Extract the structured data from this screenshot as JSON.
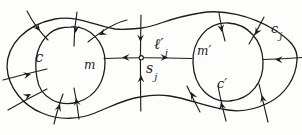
{
  "figure": {
    "description_labels": {
      "inner_cycle_left": {
        "base": "c"
      },
      "point_m": {
        "base": "m"
      },
      "separatrix_l": {
        "base": "ℓ′",
        "sub": "j"
      },
      "saddle_s": {
        "base": "s",
        "sub": "j"
      },
      "point_m_prime": {
        "base": "m′"
      },
      "inner_cycle_right": {
        "base": "c′"
      },
      "outer_curve_c": {
        "base": "c",
        "sub": "j"
      }
    },
    "colors": {
      "ink": "#1c1c1c",
      "paper": "#fdfdfc"
    }
  }
}
